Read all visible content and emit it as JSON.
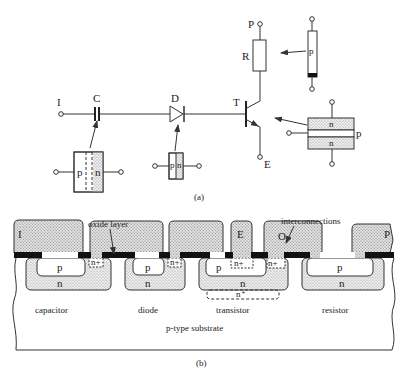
{
  "part_a": {
    "caption": "(a)",
    "labels": {
      "input": "I",
      "capacitor": "C",
      "diode": "D",
      "transistor": "T",
      "resistor": "R",
      "power": "P",
      "emitter": "E"
    },
    "inset_capacitor": {
      "left": "p",
      "right": "n"
    },
    "inset_diode": {
      "left": "p",
      "right": "n"
    },
    "inset_resistor": {
      "body": "p"
    },
    "inset_transistor": {
      "top": "n",
      "bottom": "n",
      "middle": "p"
    }
  },
  "part_b": {
    "caption": "(b)",
    "callouts": {
      "oxide": "oxide layer",
      "interconnections": "interconnections"
    },
    "terminals": {
      "input": "I",
      "emitter": "E",
      "output": "O",
      "power": "P"
    },
    "regions": {
      "p": "p",
      "n": "n",
      "nplus": "n+",
      "nplus_label": "n⁺",
      "nplus_buried": "n⁺"
    },
    "devices": [
      "capacitor",
      "diode",
      "transistor",
      "resistor"
    ],
    "substrate": "p-type substrate"
  },
  "colors": {
    "ink": "#333333",
    "stipple": "#d8d8d8",
    "metal": "#cfcfcf",
    "oxide": "#111111"
  }
}
